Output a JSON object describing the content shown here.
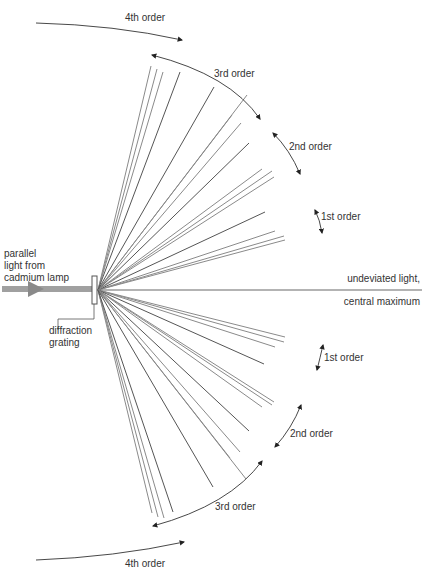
{
  "labels": {
    "source": [
      "parallel",
      "light from",
      "cadmium lamp"
    ],
    "grating": [
      "diffraction",
      "grating"
    ],
    "central": [
      "undeviated light,",
      "central maximum"
    ],
    "orders_top": [
      "1st order",
      "2nd order",
      "3rd order",
      "4th order"
    ],
    "orders_bottom": [
      "1st order",
      "2nd order",
      "3rd order",
      "4th order"
    ]
  },
  "colors": {
    "ray": "#8a8a8a",
    "ray_dark": "#555555",
    "beam": "#9a9a9a",
    "arrow": "#222222",
    "text": "#333333"
  },
  "rays_top": [
    [
      285,
      240
    ],
    [
      284,
      236
    ],
    [
      275,
      231
    ],
    [
      265,
      212
    ],
    [
      274,
      177
    ],
    [
      272,
      171
    ],
    [
      262,
      169
    ],
    [
      249,
      143
    ],
    [
      241,
      123
    ],
    [
      232,
      115
    ],
    [
      247,
      95
    ],
    [
      214,
      87
    ],
    [
      157,
      69
    ],
    [
      151,
      66
    ],
    [
      163,
      72
    ],
    [
      180,
      72
    ]
  ],
  "rays_bottom": [
    [
      285,
      337
    ],
    [
      284,
      342
    ],
    [
      275,
      347
    ],
    [
      264,
      364
    ],
    [
      274,
      402
    ],
    [
      272,
      405
    ],
    [
      262,
      407
    ],
    [
      249,
      431
    ],
    [
      240,
      452
    ],
    [
      230,
      458
    ],
    [
      246,
      479
    ],
    [
      213,
      487
    ],
    [
      158,
      517
    ],
    [
      152,
      513
    ],
    [
      164,
      518
    ],
    [
      173,
      512
    ]
  ]
}
